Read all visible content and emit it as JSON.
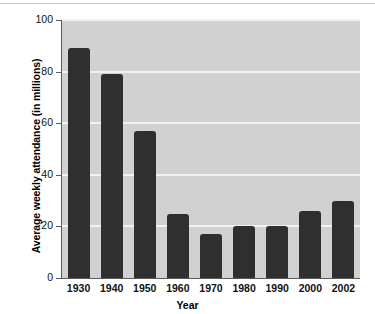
{
  "chart_data": {
    "type": "bar",
    "title": "",
    "xlabel": "Year",
    "ylabel": "Average weekly attendance (in millions)",
    "categories": [
      "1930",
      "1940",
      "1950",
      "1960",
      "1970",
      "1980",
      "1990",
      "2000",
      "2002"
    ],
    "values": [
      89,
      79,
      57,
      25,
      17,
      20,
      20,
      26,
      30
    ],
    "ylim": [
      0,
      100
    ],
    "yticks": [
      "0",
      "20",
      "40",
      "60",
      "80",
      "100"
    ],
    "ytick_values": [
      0,
      20,
      40,
      60,
      80,
      100
    ],
    "grid": "horizontal",
    "legend": "none",
    "bar_color": "#2f2f2f",
    "plot_background": "#d1d1d1",
    "gridline_color": "#f2f2f2"
  }
}
